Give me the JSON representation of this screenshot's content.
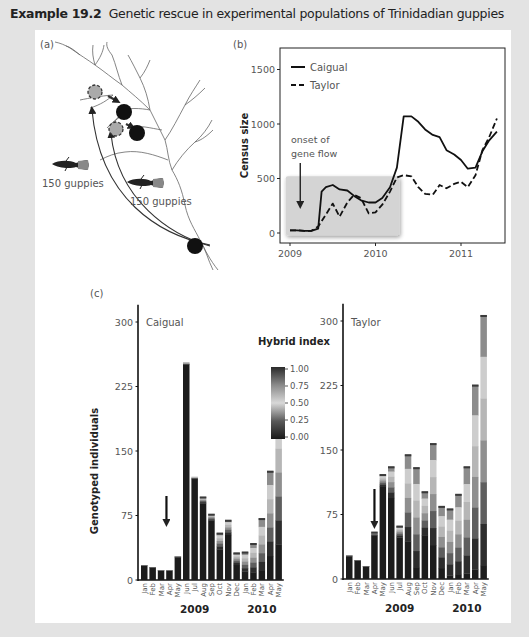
{
  "header": {
    "label": "Example 19.2",
    "title": "Genetic rescue in experimental populations of Trinidadian guppies"
  },
  "panel_a": {
    "tag": "(a)",
    "release_label_1": "150 guppies",
    "release_label_2": "150 guppies",
    "icons": [
      "river-network",
      "source-site-circle",
      "release-site-dashed-circle",
      "resident-population-circle",
      "guppy-fish",
      "transfer-arrow"
    ]
  },
  "chart_data": [
    {
      "id": "b",
      "tag": "(b)",
      "type": "line",
      "title": "",
      "xlabel": "",
      "ylabel": "Census size",
      "xlim": [
        2009,
        2011.5
      ],
      "ylim": [
        -60,
        1700
      ],
      "xticks": [
        2009,
        2010,
        2011
      ],
      "yticks": [
        0,
        500,
        1000,
        1500
      ],
      "legend": "top-left",
      "annotation": {
        "text_line1": "onset of",
        "text_line2": "gene flow",
        "x": 2009.12
      },
      "shaded_region": {
        "x": [
          2008.95,
          2010.28
        ],
        "y": [
          -20,
          520
        ]
      },
      "series": [
        {
          "name": "Caigual",
          "style": "solid",
          "x": [
            2009.0,
            2009.08,
            2009.17,
            2009.25,
            2009.33,
            2009.37,
            2009.42,
            2009.5,
            2009.58,
            2009.67,
            2009.75,
            2009.83,
            2009.92,
            2010.0,
            2010.08,
            2010.17,
            2010.25,
            2010.33,
            2010.42,
            2010.5,
            2010.58,
            2010.67,
            2010.75,
            2010.83,
            2010.92,
            2011.0,
            2011.08,
            2011.17,
            2011.25,
            2011.33,
            2011.42
          ],
          "values": [
            25,
            25,
            20,
            20,
            40,
            380,
            420,
            440,
            400,
            390,
            340,
            300,
            280,
            280,
            320,
            420,
            600,
            1070,
            1070,
            1020,
            950,
            900,
            880,
            760,
            720,
            670,
            590,
            600,
            750,
            850,
            930
          ]
        },
        {
          "name": "Taylor",
          "style": "dashed",
          "x": [
            2009.0,
            2009.08,
            2009.17,
            2009.25,
            2009.33,
            2009.42,
            2009.5,
            2009.58,
            2009.67,
            2009.75,
            2009.83,
            2009.92,
            2010.0,
            2010.08,
            2010.17,
            2010.25,
            2010.33,
            2010.42,
            2010.5,
            2010.58,
            2010.67,
            2010.75,
            2010.83,
            2010.92,
            2011.0,
            2011.08,
            2011.17,
            2011.25,
            2011.33,
            2011.42
          ],
          "values": [
            25,
            25,
            20,
            20,
            60,
            170,
            270,
            150,
            280,
            350,
            320,
            180,
            190,
            260,
            380,
            510,
            530,
            520,
            420,
            360,
            350,
            440,
            410,
            450,
            470,
            420,
            530,
            760,
            880,
            1050
          ]
        }
      ]
    },
    {
      "id": "c-caigual",
      "tag": "(c)",
      "type": "bar",
      "title": "Caigual",
      "ylabel": "Genotyped individuals",
      "ylim": [
        0,
        320
      ],
      "yticks": [
        0,
        75,
        150,
        225,
        300
      ],
      "categories": [
        "Jan",
        "Feb",
        "Mar",
        "Apr",
        "May",
        "Jun",
        "Jul",
        "Aug",
        "Sep",
        "Oct",
        "Nov",
        "Dec",
        "Jan",
        "Feb",
        "Mar",
        "Apr",
        "May"
      ],
      "year_labels": [
        {
          "text": "2009",
          "index": 6
        },
        {
          "text": "2010",
          "index": 14
        }
      ],
      "arrow_at_index": 3,
      "values": [
        17,
        15,
        11,
        11,
        27,
        253,
        120,
        97,
        77,
        55,
        70,
        32,
        33,
        43,
        72,
        127,
        208
      ],
      "hybrid_fraction": [
        0,
        0,
        0,
        0,
        0,
        0.01,
        0.02,
        0.08,
        0.1,
        0.35,
        0.25,
        0.45,
        0.7,
        0.8,
        0.85,
        0.78,
        0.8
      ]
    },
    {
      "id": "c-taylor",
      "type": "bar",
      "title": "Taylor",
      "ylabel": "",
      "ylim": [
        0,
        320
      ],
      "yticks": [
        0,
        75,
        150,
        225,
        300
      ],
      "categories": [
        "Jan",
        "Feb",
        "Mar",
        "Apr",
        "May",
        "Jun",
        "Jul",
        "Aug",
        "Sep",
        "Oct",
        "Nov",
        "Dec",
        "Jan",
        "Feb",
        "Mar",
        "Apr",
        "May"
      ],
      "year_labels": [
        {
          "text": "2009",
          "index": 6
        },
        {
          "text": "2010",
          "index": 14
        }
      ],
      "arrow_at_index": 3,
      "values": [
        27,
        22,
        15,
        55,
        122,
        131,
        62,
        145,
        130,
        102,
        158,
        85,
        82,
        99,
        131,
        226,
        307
      ],
      "hybrid_fraction": [
        0,
        0,
        0,
        0.08,
        0.12,
        0.28,
        0.22,
        0.7,
        0.9,
        0.5,
        0.75,
        0.85,
        0.95,
        0.95,
        0.95,
        0.95,
        0.95
      ]
    },
    {
      "id": "hybrid-legend",
      "type": "heatmap",
      "title": "Hybrid index",
      "ticks": [
        "1.00",
        "0.75",
        "0.50",
        "0.25",
        "0.00"
      ],
      "range": [
        0,
        1
      ]
    }
  ]
}
